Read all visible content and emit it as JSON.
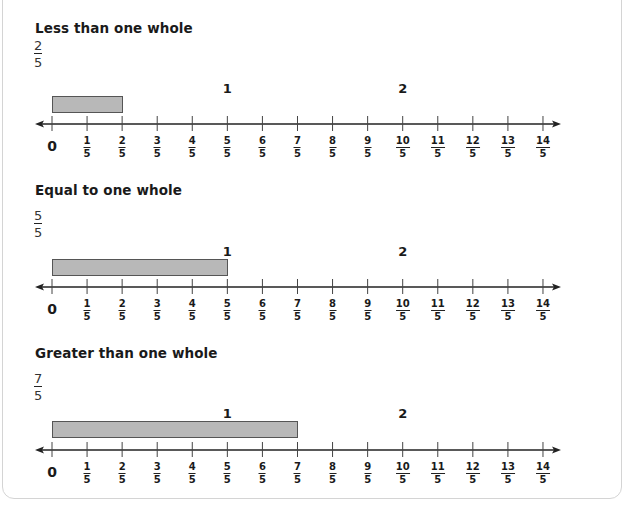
{
  "colors": {
    "bar_fill": "#b8b8b8",
    "bar_border": "#555555",
    "axis": "#222222",
    "card_border": "#d4d4d4"
  },
  "axis": {
    "origin_label": "0",
    "denominator": "5",
    "numerators": [
      "1",
      "2",
      "3",
      "4",
      "5",
      "6",
      "7",
      "8",
      "9",
      "10",
      "11",
      "12",
      "13",
      "14"
    ],
    "whole_labels": [
      {
        "value": "1",
        "at_index": 5
      },
      {
        "value": "2",
        "at_index": 10
      }
    ],
    "arrows": [
      "left",
      "right"
    ]
  },
  "sections": [
    {
      "title": "Less than one whole",
      "fraction": {
        "numerator": "2",
        "denominator": "5"
      },
      "bar_end_index": 2
    },
    {
      "title": "Equal to one whole",
      "fraction": {
        "numerator": "5",
        "denominator": "5"
      },
      "bar_end_index": 5
    },
    {
      "title": "Greater than one whole",
      "fraction": {
        "numerator": "7",
        "denominator": "5"
      },
      "bar_end_index": 7
    }
  ]
}
